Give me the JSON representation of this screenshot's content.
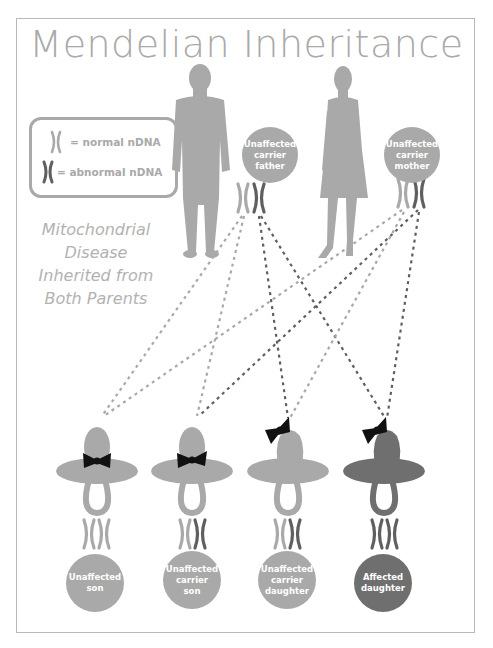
{
  "title": "Mendelian Inheritance",
  "subtitle": {
    "lines": [
      "Mitochondrial",
      "Disease",
      "Inherited from",
      "Both Parents"
    ]
  },
  "legend": {
    "items": [
      {
        "icon": "normal-chromosome",
        "label": "= normal nDNA",
        "color": "#a9a9a9"
      },
      {
        "icon": "abnormal-chromosome",
        "label": "= abnormal nDNA",
        "color": "#5f5f5f"
      }
    ]
  },
  "parents": [
    {
      "id": "father",
      "label_lines": [
        "Unaffected",
        "carrier",
        "father"
      ],
      "chromosomes": [
        "normal",
        "abnormal"
      ]
    },
    {
      "id": "mother",
      "label_lines": [
        "Unaffected",
        "carrier",
        "mother"
      ],
      "chromosomes": [
        "normal",
        "abnormal"
      ]
    }
  ],
  "children": [
    {
      "id": "son-1",
      "sex": "male",
      "status": "unaffected",
      "label_lines": [
        "Unaffected",
        "son"
      ],
      "chromosomes": [
        "normal",
        "normal"
      ]
    },
    {
      "id": "son-2",
      "sex": "male",
      "status": "carrier",
      "label_lines": [
        "Unaffected",
        "carrier",
        "son"
      ],
      "chromosomes": [
        "normal",
        "abnormal"
      ]
    },
    {
      "id": "daughter-1",
      "sex": "female",
      "status": "carrier",
      "label_lines": [
        "Unaffected",
        "carrier",
        "daughter"
      ],
      "chromosomes": [
        "normal",
        "abnormal"
      ]
    },
    {
      "id": "daughter-2",
      "sex": "female",
      "status": "affected",
      "label_lines": [
        "Affected",
        "daughter"
      ],
      "chromosomes": [
        "abnormal",
        "abnormal"
      ]
    }
  ],
  "inheritance_lines": [
    {
      "from": "father-normal",
      "to": "son-1"
    },
    {
      "from": "father-normal",
      "to": "son-2"
    },
    {
      "from": "father-abnormal",
      "to": "daughter-1"
    },
    {
      "from": "father-abnormal",
      "to": "daughter-2"
    },
    {
      "from": "mother-normal",
      "to": "son-1"
    },
    {
      "from": "mother-normal",
      "to": "daughter-1"
    },
    {
      "from": "mother-abnormal",
      "to": "son-2"
    },
    {
      "from": "mother-abnormal",
      "to": "daughter-2"
    }
  ],
  "colors": {
    "light": "#a9a9a9",
    "dark": "#6f6f6f",
    "chromosome_dark": "#5f5f5f",
    "bow": "#111111",
    "frame": "#b9b9b9"
  }
}
